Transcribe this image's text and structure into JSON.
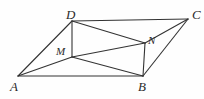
{
  "figure": {
    "background_color": "#fefefe",
    "stroke_color": "#333333",
    "label_color": "#2b2b2b",
    "width": 204,
    "height": 99,
    "points": {
      "A": {
        "label": "A",
        "x": 18,
        "y": 76,
        "label_x": 10,
        "label_y": 80
      },
      "B": {
        "label": "B",
        "x": 143,
        "y": 76,
        "label_x": 138,
        "label_y": 80
      },
      "C": {
        "label": "C",
        "x": 188,
        "y": 19,
        "label_x": 192,
        "label_y": 8
      },
      "D": {
        "label": "D",
        "x": 72,
        "y": 21,
        "label_x": 66,
        "label_y": 8
      },
      "M": {
        "label": "M",
        "x": 72,
        "y": 57,
        "label_x": 56,
        "label_y": 46
      },
      "N": {
        "label": "N",
        "x": 145,
        "y": 43,
        "label_x": 148,
        "label_y": 35
      }
    },
    "edges": [
      {
        "name": "A-D",
        "from": "A",
        "to": "D"
      },
      {
        "name": "A-B",
        "from": "A",
        "to": "B"
      },
      {
        "name": "A-M",
        "from": "A",
        "to": "M"
      },
      {
        "name": "D-C",
        "from": "D",
        "to": "C"
      },
      {
        "name": "B-C",
        "from": "B",
        "to": "C"
      },
      {
        "name": "D-M",
        "from": "D",
        "to": "M"
      },
      {
        "name": "D-N",
        "from": "D",
        "to": "N"
      },
      {
        "name": "M-N",
        "from": "M",
        "to": "N"
      },
      {
        "name": "M-B",
        "from": "M",
        "to": "B"
      },
      {
        "name": "N-B",
        "from": "N",
        "to": "B"
      },
      {
        "name": "N-C",
        "from": "N",
        "to": "C"
      }
    ]
  }
}
